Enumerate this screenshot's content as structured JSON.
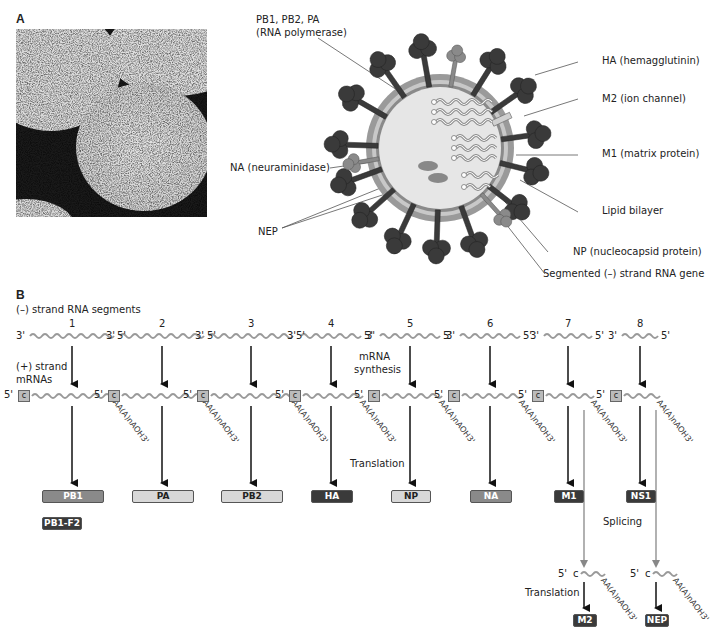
{
  "panelA": {
    "letter": "A",
    "labels": {
      "polymerase": [
        "PB1, PB2, PA",
        "(RNA polymerase)"
      ],
      "ha": "HA (hemagglutinin)",
      "m2": "M2 (ion channel)",
      "m1": "M1 (matrix protein)",
      "lipid": "Lipid bilayer",
      "np": "NP (nucleocapsid protein)",
      "segmented": "Segmented (–) strand RNA gene",
      "na": "NA (neuraminidase)",
      "nep": "NEP"
    }
  },
  "panelB": {
    "letter": "B",
    "neg_strand_title": "(–) strand RNA segments",
    "pos_strand_title": [
      "(+) strand",
      "mRNAs"
    ],
    "mrna_synthesis": [
      "mRNA",
      "synthesis"
    ],
    "translation": "Translation",
    "splicing": "Splicing",
    "translation2": "Translation",
    "end3": "3'",
    "end5": "5'",
    "cap": "c",
    "polyA": "AA(A)nAOH3'",
    "segments": [
      {
        "num": "1",
        "protein": "PB1",
        "style": "mid"
      },
      {
        "num": "2",
        "protein": "PA",
        "style": "light"
      },
      {
        "num": "3",
        "protein": "PB2",
        "style": "light"
      },
      {
        "num": "4",
        "protein": "HA",
        "style": "dark"
      },
      {
        "num": "5",
        "protein": "NP",
        "style": "light"
      },
      {
        "num": "6",
        "protein": "NA",
        "style": "mid"
      },
      {
        "num": "7",
        "protein": "M1",
        "style": "dark"
      },
      {
        "num": "8",
        "protein": "NS1",
        "style": "dark"
      }
    ],
    "extra_protein": "PB1-F2",
    "spliced": [
      {
        "protein": "M2"
      },
      {
        "protein": "NEP"
      }
    ]
  }
}
